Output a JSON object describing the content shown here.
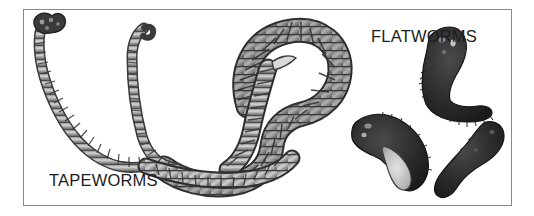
{
  "plate": {
    "background_color": "#ffffff",
    "frame": {
      "border_color": "#8a8a8a",
      "fill_color": "#ffffff"
    }
  },
  "captions": [
    {
      "id": "tapeworms",
      "text": "TAPEWORMS",
      "color": "#1c1c1c"
    },
    {
      "id": "flatworms",
      "text": "FLATWORMS",
      "color": "#1c1c1c"
    }
  ],
  "illustration": {
    "style": "grayscale ink drawing",
    "ink_dark": "#2a2a2a",
    "ink_mid": "#6f6f6f",
    "ink_light": "#c9c9c9",
    "groups": [
      {
        "name": "tapeworms",
        "label": "TAPEWORMS",
        "count": 3,
        "description": "long segmented ribbon-shaped worms with proglottid bands",
        "specimens": [
          {
            "name": "tapeworm-thin-left",
            "feature": "knobby scolex head at top, slender descending segmented strand"
          },
          {
            "name": "tapeworm-thin-middle",
            "feature": "hooked upper tip, narrow segmented body curving down and left"
          },
          {
            "name": "tapeworm-large-coiled",
            "feature": "broad heavily segmented body looped into a coil"
          }
        ]
      },
      {
        "name": "flatworms",
        "label": "FLATWORMS",
        "count": 3,
        "description": "short dark flattened bodies with fringed margins",
        "specimens": [
          {
            "name": "flatworm-upper",
            "feature": "hook-shaped dark body with fringed ventral edge"
          },
          {
            "name": "flatworm-middle",
            "feature": "curved body with pale gray inner sucker region"
          },
          {
            "name": "flatworm-lower",
            "feature": "thick S-curved solid dark body"
          }
        ]
      }
    ]
  }
}
